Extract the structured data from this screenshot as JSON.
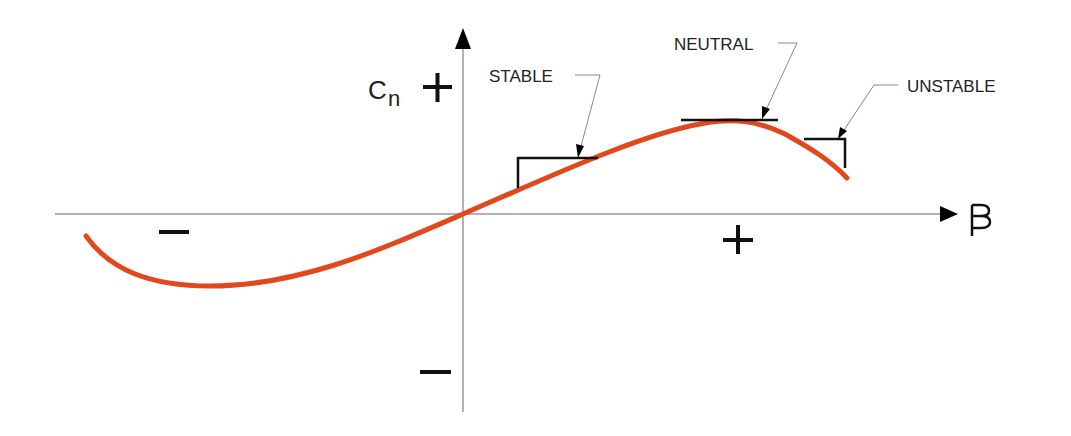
{
  "diagram": {
    "y_axis": {
      "label_main": "C",
      "label_sub": "n",
      "positive_sign": "+",
      "negative_sign": "−"
    },
    "x_axis": {
      "label": "β",
      "positive_sign": "+",
      "negative_sign": "−"
    },
    "annotations": [
      {
        "id": "stable",
        "label": "STABLE",
        "description": "positive slope region"
      },
      {
        "id": "neutral",
        "label": "NEUTRAL",
        "description": "zero slope at peak"
      },
      {
        "id": "unstable",
        "label": "UNSTABLE",
        "description": "negative slope region"
      }
    ],
    "colors": {
      "curve": "#e2481c",
      "axis": "#9a9a9a",
      "bracket": "#111111",
      "leader": "#8a8a8a",
      "text": "#222222",
      "background": "#ffffff"
    }
  }
}
